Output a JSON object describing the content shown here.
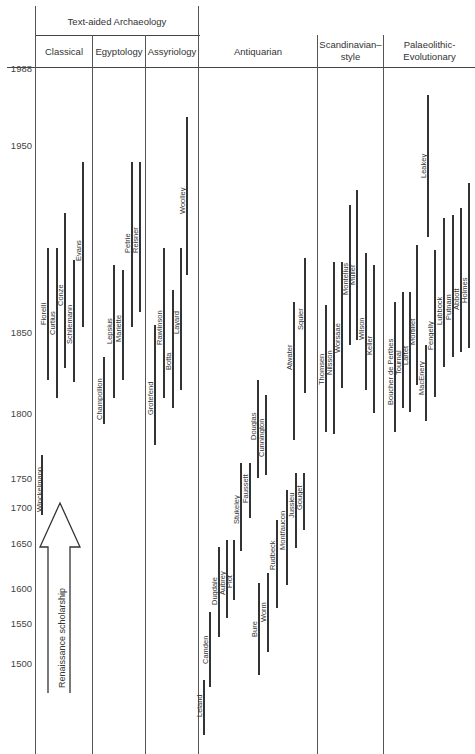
{
  "chart_data": {
    "type": "timeline",
    "title": "",
    "group_header": "Text-aided Archaeology",
    "columns": [
      "Classical",
      "Egyptology",
      "Assyriology",
      "Antiquarian",
      "Scandinavian-style",
      "Palaeolithic-Evolutionary"
    ],
    "column_headers": {
      "classical": "Classical",
      "egyptology": "Egyptology",
      "assyriology": "Assyriology",
      "antiquarian": "Antiquarian",
      "scandinavian_1": "Scandinavian–",
      "scandinavian_2": "style",
      "palaeo_1": "Palaeolithic-",
      "palaeo_2": "Evolutionary"
    },
    "y_ticks": [
      {
        "label": "1988",
        "y": 63
      },
      {
        "label": "1950",
        "y": 140
      },
      {
        "label": "1850",
        "y": 327
      },
      {
        "label": "1800",
        "y": 408
      },
      {
        "label": "1750",
        "y": 473
      },
      {
        "label": "1700",
        "y": 502
      },
      {
        "label": "1650",
        "y": 538
      },
      {
        "label": "1600",
        "y": 583
      },
      {
        "label": "1550",
        "y": 618
      },
      {
        "label": "1500",
        "y": 658
      }
    ],
    "annotation": "Renaissance scholarship",
    "series": [
      {
        "name": "Winckelmann",
        "column": "Classical",
        "x": 41,
        "y1": 455,
        "y2": 515,
        "lx": 36,
        "ly": 512
      },
      {
        "name": "Fiorelli",
        "column": "Classical",
        "x": 47,
        "y1": 248,
        "y2": 380,
        "lx": 40,
        "ly": 325
      },
      {
        "name": "Curtius",
        "column": "Classical",
        "x": 56,
        "y1": 248,
        "y2": 398,
        "lx": 49,
        "ly": 335
      },
      {
        "name": "Conze",
        "column": "Classical",
        "x": 64,
        "y1": 213,
        "y2": 368,
        "lx": 57,
        "ly": 306
      },
      {
        "name": "Schliemann",
        "column": "Classical",
        "x": 73,
        "y1": 260,
        "y2": 382,
        "lx": 66,
        "ly": 344
      },
      {
        "name": "Evans",
        "column": "Classical",
        "x": 82,
        "y1": 162,
        "y2": 327,
        "lx": 75,
        "ly": 261
      },
      {
        "name": "Champollion",
        "column": "Egyptology",
        "x": 103,
        "y1": 357,
        "y2": 424,
        "lx": 96,
        "ly": 420
      },
      {
        "name": "Lepsius",
        "column": "Egyptology",
        "x": 113,
        "y1": 265,
        "y2": 398,
        "lx": 106,
        "ly": 344
      },
      {
        "name": "Mariette",
        "column": "Egyptology",
        "x": 122,
        "y1": 270,
        "y2": 380,
        "lx": 115,
        "ly": 342
      },
      {
        "name": "Petrie",
        "column": "Egyptology",
        "x": 131,
        "y1": 162,
        "y2": 327,
        "lx": 124,
        "ly": 253
      },
      {
        "name": "Reisner",
        "column": "Egyptology",
        "x": 139,
        "y1": 162,
        "y2": 312,
        "lx": 132,
        "ly": 253
      },
      {
        "name": "Grotefend",
        "column": "Assyriology",
        "x": 154,
        "y1": 325,
        "y2": 445,
        "lx": 147,
        "ly": 415
      },
      {
        "name": "Rawlinson",
        "column": "Assyriology",
        "x": 163,
        "y1": 248,
        "y2": 398,
        "lx": 156,
        "ly": 345
      },
      {
        "name": "Botta",
        "column": "Assyriology",
        "x": 172,
        "y1": 290,
        "y2": 408,
        "lx": 165,
        "ly": 370
      },
      {
        "name": "Layard",
        "column": "Assyriology",
        "x": 180,
        "y1": 248,
        "y2": 390,
        "lx": 173,
        "ly": 334
      },
      {
        "name": "Woolley",
        "column": "Assyriology",
        "x": 186,
        "y1": 117,
        "y2": 275,
        "lx": 179,
        "ly": 214
      },
      {
        "name": "Leland",
        "column": "Antiquarian",
        "x": 203,
        "y1": 680,
        "y2": 735,
        "lx": 196,
        "ly": 717
      },
      {
        "name": "Camden",
        "column": "Antiquarian",
        "x": 209,
        "y1": 612,
        "y2": 687,
        "lx": 202,
        "ly": 664
      },
      {
        "name": "Dugdale",
        "column": "Antiquarian",
        "x": 218,
        "y1": 547,
        "y2": 637,
        "lx": 211,
        "ly": 605
      },
      {
        "name": "Aubrey",
        "column": "Antiquarian",
        "x": 226,
        "y1": 540,
        "y2": 618,
        "lx": 219,
        "ly": 595
      },
      {
        "name": "Plot",
        "column": "Antiquarian",
        "x": 233,
        "y1": 540,
        "y2": 600,
        "lx": 226,
        "ly": 588
      },
      {
        "name": "Stukeley",
        "column": "Antiquarian",
        "x": 240,
        "y1": 463,
        "y2": 551,
        "lx": 233,
        "ly": 524
      },
      {
        "name": "Faussett",
        "column": "Antiquarian",
        "x": 249,
        "y1": 463,
        "y2": 518,
        "lx": 242,
        "ly": 503
      },
      {
        "name": "Douglas",
        "column": "Antiquarian",
        "x": 257,
        "y1": 380,
        "y2": 478,
        "lx": 250,
        "ly": 440
      },
      {
        "name": "Cunnington",
        "column": "Antiquarian",
        "x": 265,
        "y1": 395,
        "y2": 475,
        "lx": 258,
        "ly": 457
      },
      {
        "name": "Bure",
        "column": "Antiquarian",
        "x": 258,
        "y1": 583,
        "y2": 675,
        "lx": 251,
        "ly": 637
      },
      {
        "name": "Worm",
        "column": "Antiquarian",
        "x": 267,
        "y1": 573,
        "y2": 652,
        "lx": 260,
        "ly": 622
      },
      {
        "name": "Rudbeck",
        "column": "Antiquarian",
        "x": 276,
        "y1": 520,
        "y2": 608,
        "lx": 269,
        "ly": 570
      },
      {
        "name": "Montfaucon",
        "column": "Antiquarian",
        "x": 286,
        "y1": 490,
        "y2": 585,
        "lx": 279,
        "ly": 550
      },
      {
        "name": "Jussieu",
        "column": "Antiquarian",
        "x": 295,
        "y1": 473,
        "y2": 548,
        "lx": 288,
        "ly": 518
      },
      {
        "name": "Gouget",
        "column": "Antiquarian",
        "x": 303,
        "y1": 473,
        "y2": 530,
        "lx": 296,
        "ly": 510
      },
      {
        "name": "Atwater",
        "column": "Antiquarian",
        "x": 293,
        "y1": 302,
        "y2": 440,
        "lx": 286,
        "ly": 370
      },
      {
        "name": "Squier",
        "column": "Antiquarian",
        "x": 304,
        "y1": 258,
        "y2": 393,
        "lx": 297,
        "ly": 330
      },
      {
        "name": "Thomsen",
        "column": "Scandinavian-style",
        "x": 325,
        "y1": 305,
        "y2": 432,
        "lx": 318,
        "ly": 385
      },
      {
        "name": "Nilsson",
        "column": "Scandinavian-style",
        "x": 333,
        "y1": 262,
        "y2": 434,
        "lx": 326,
        "ly": 375
      },
      {
        "name": "Worsaae",
        "column": "Scandinavian-style",
        "x": 341,
        "y1": 262,
        "y2": 388,
        "lx": 334,
        "ly": 353
      },
      {
        "name": "Montelius",
        "column": "Scandinavian-style",
        "x": 349,
        "y1": 205,
        "y2": 345,
        "lx": 342,
        "ly": 295
      },
      {
        "name": "Müller",
        "column": "Scandinavian-style",
        "x": 356,
        "y1": 190,
        "y2": 340,
        "lx": 349,
        "ly": 285
      },
      {
        "name": "Wilson",
        "column": "Scandinavian-style",
        "x": 365,
        "y1": 253,
        "y2": 390,
        "lx": 358,
        "ly": 340
      },
      {
        "name": "Keller",
        "column": "Scandinavian-style",
        "x": 373,
        "y1": 265,
        "y2": 413,
        "lx": 366,
        "ly": 355
      },
      {
        "name": "Boucher de Perthes",
        "column": "Palaeolithic-Evolutionary",
        "x": 394,
        "y1": 302,
        "y2": 432,
        "lx": 387,
        "ly": 405
      },
      {
        "name": "Tournal",
        "column": "Palaeolithic-Evolutionary",
        "x": 402,
        "y1": 292,
        "y2": 408,
        "lx": 395,
        "ly": 375
      },
      {
        "name": "Lartet",
        "column": "Palaeolithic-Evolutionary",
        "x": 409,
        "y1": 292,
        "y2": 412,
        "lx": 402,
        "ly": 365
      },
      {
        "name": "Mortillet",
        "column": "Palaeolithic-Evolutionary",
        "x": 416,
        "y1": 245,
        "y2": 385,
        "lx": 409,
        "ly": 345
      },
      {
        "name": "MacEnery",
        "column": "Palaeolithic-Evolutionary",
        "x": 425,
        "y1": 345,
        "y2": 421,
        "lx": 418,
        "ly": 395
      },
      {
        "name": "Pengelly",
        "column": "Palaeolithic-Evolutionary",
        "x": 434,
        "y1": 250,
        "y2": 397,
        "lx": 427,
        "ly": 350
      },
      {
        "name": "Lubbock",
        "column": "Palaeolithic-Evolutionary",
        "x": 443,
        "y1": 218,
        "y2": 367,
        "lx": 436,
        "ly": 325
      },
      {
        "name": "Putnam",
        "column": "Palaeolithic-Evolutionary",
        "x": 452,
        "y1": 215,
        "y2": 357,
        "lx": 445,
        "ly": 320
      },
      {
        "name": "Abbott",
        "column": "Palaeolithic-Evolutionary",
        "x": 460,
        "y1": 208,
        "y2": 352,
        "lx": 453,
        "ly": 310
      },
      {
        "name": "Holmes",
        "column": "Palaeolithic-Evolutionary",
        "x": 468,
        "y1": 183,
        "y2": 348,
        "lx": 461,
        "ly": 303
      },
      {
        "name": "Leakey",
        "column": "Palaeolithic-Evolutionary",
        "x": 427,
        "y1": 95,
        "y2": 237,
        "lx": 420,
        "ly": 178
      }
    ]
  }
}
